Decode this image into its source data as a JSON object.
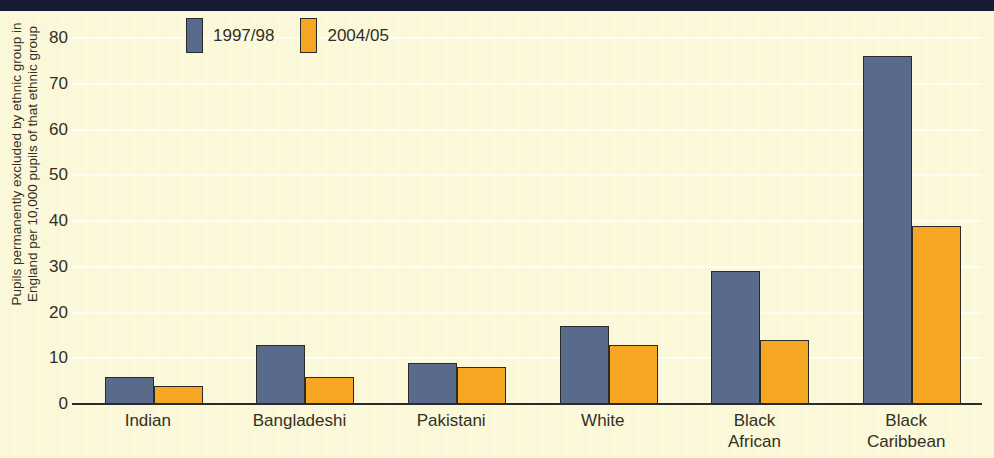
{
  "chart_data": {
    "type": "bar",
    "title": "",
    "subtitle": "",
    "xlabel": "",
    "ylabel": "Pupils permanently excluded by ethnic group in England per 10,000 pupils of that ethnic group",
    "ylabel_line1": "Pupils permanently excluded by ethnic group in",
    "ylabel_line2": "England per 10,000 pupils of that ethnic group",
    "categories": [
      "Indian",
      "Bangladeshi",
      "Pakistani",
      "White",
      "Black African",
      "Black Caribbean"
    ],
    "category_lines": [
      [
        "Indian"
      ],
      [
        "Bangladeshi"
      ],
      [
        "Pakistani"
      ],
      [
        "White"
      ],
      [
        "Black",
        "African"
      ],
      [
        "Black",
        "Caribbean"
      ]
    ],
    "series": [
      {
        "name": "1997/98",
        "color": "#5a6a8a",
        "values": [
          6,
          13,
          9,
          17,
          29,
          76
        ]
      },
      {
        "name": "2004/05",
        "color": "#f5a623",
        "values": [
          4,
          6,
          8,
          13,
          14,
          39
        ]
      }
    ],
    "ylim": [
      0,
      80
    ],
    "yticks": [
      80,
      70,
      60,
      50,
      40,
      30,
      20,
      10,
      0
    ],
    "ytick_labels": [
      "80",
      "70",
      "60",
      "50",
      "40",
      "30",
      "20",
      "10",
      "0"
    ],
    "grid": true,
    "grid_color": "#ffffff",
    "legend_position": "top-left",
    "background_color": "#fbf8d8"
  },
  "legend": {
    "items": [
      {
        "label": "1997/98",
        "swatch": "legend-swatch-1997-98"
      },
      {
        "label": "2004/05",
        "swatch": "legend-swatch-2004-05"
      }
    ]
  }
}
